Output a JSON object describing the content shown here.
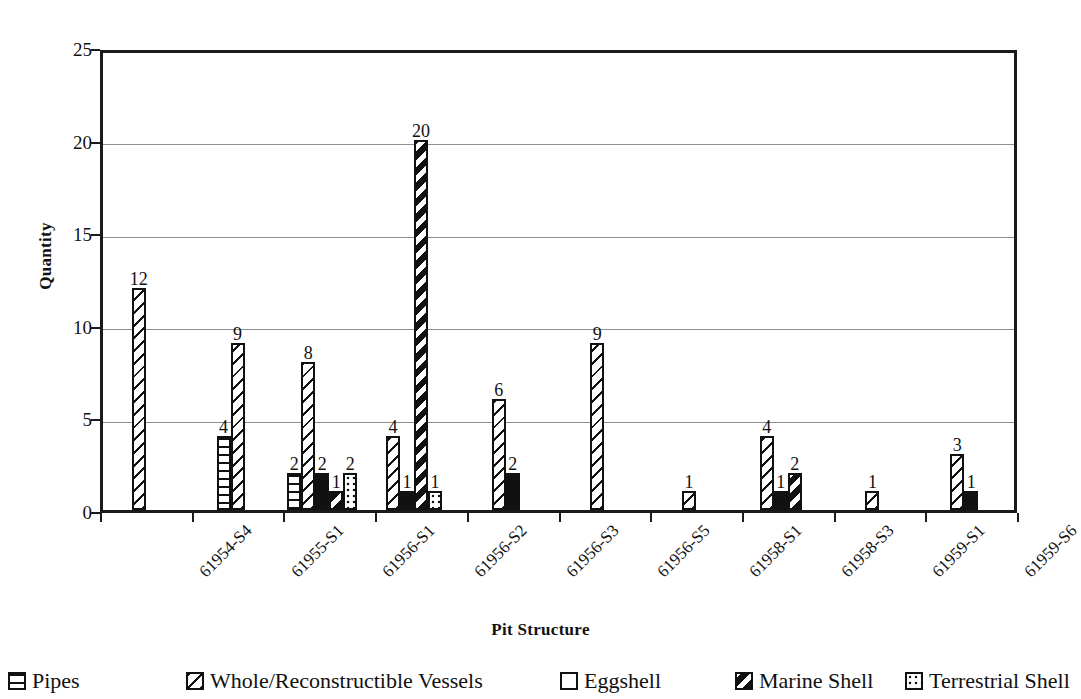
{
  "chart_data": {
    "type": "bar",
    "title": "",
    "xlabel": "Pit Structure",
    "ylabel": "Quantity",
    "ylim": [
      0,
      25
    ],
    "yticks": [
      0,
      5,
      10,
      15,
      20,
      25
    ],
    "grid": true,
    "legend_position": "bottom",
    "categories": [
      "61954-S4",
      "61955-S1",
      "61956-S1",
      "61956-S2",
      "61956-S3",
      "61956-S5",
      "61958-S1",
      "61958-S3",
      "61959-S1",
      "61959-S6"
    ],
    "series": [
      {
        "name": "Pipes",
        "pattern": "horizontal-lines",
        "values": [
          0,
          4,
          2,
          0,
          0,
          0,
          0,
          0,
          0,
          0
        ]
      },
      {
        "name": "Whole/Reconstructible Vessels",
        "pattern": "diagonal-hatch",
        "values": [
          12,
          9,
          8,
          4,
          6,
          9,
          1,
          4,
          1,
          3
        ]
      },
      {
        "name": "Eggshell",
        "pattern": "solid-black",
        "values": [
          0,
          0,
          2,
          1,
          2,
          0,
          0,
          1,
          0,
          1
        ]
      },
      {
        "name": "Marine Shell",
        "pattern": "bold-diagonal",
        "values": [
          0,
          0,
          1,
          20,
          0,
          0,
          0,
          2,
          0,
          0
        ]
      },
      {
        "name": "Terrestrial Shell",
        "pattern": "stipple-dots",
        "values": [
          0,
          0,
          2,
          1,
          0,
          0,
          0,
          0,
          0,
          0
        ]
      }
    ],
    "data_labels_shown": true
  },
  "axis": {
    "y_title": "Quantity",
    "x_title": "Pit Structure",
    "y_tick_labels": [
      "25",
      "20",
      "15",
      "10",
      "5",
      "0"
    ]
  },
  "legend": {
    "items": [
      {
        "label": "Pipes",
        "swatch": "horizontal-lines-swatch"
      },
      {
        "label": "Whole/Reconstructible Vessels",
        "swatch": "diagonal-hatch-swatch"
      },
      {
        "label": "Eggshell",
        "swatch": "solid-black-swatch"
      },
      {
        "label": "Marine Shell",
        "swatch": "bold-diagonal-swatch"
      },
      {
        "label": "Terrestrial Shell",
        "swatch": "stipple-dots-swatch"
      }
    ]
  },
  "colors": {
    "ink": "#111111",
    "grid": "#8d8d8d",
    "background": "#ffffff"
  }
}
